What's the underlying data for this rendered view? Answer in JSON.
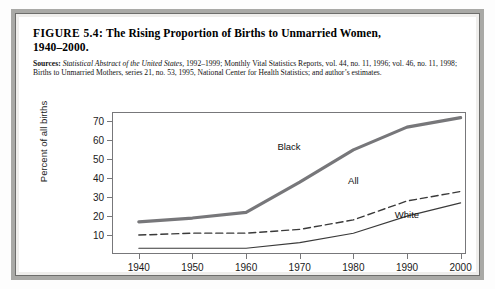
{
  "figure": {
    "label": "FIGURE 5.4:",
    "title_line1": "The Rising Proportion of Births to Unmarried Women,",
    "title_line2": "1940–2000.",
    "sources_label": "Sources:",
    "sources_italic": "Statistical Abstract of the United States,",
    "sources_text": " 1992–1999; Monthly Vital Statistics Reports, vol. 44, no. 11, 1996; vol. 46, no. 11, 1998; Births to Unmarried Mothers, series 21, no. 53, 1995, National Center for Health Statistics; and author’s estimates."
  },
  "chart_data": {
    "type": "line",
    "title": "The Rising Proportion of Births to Unmarried Women, 1940–2000.",
    "xlabel": "",
    "ylabel": "Percent of all births",
    "x": [
      1940,
      1950,
      1960,
      1970,
      1980,
      1990,
      2000
    ],
    "xlim": [
      1935,
      2001
    ],
    "ylim": [
      0,
      75
    ],
    "yticks": [
      10,
      20,
      30,
      40,
      50,
      60,
      70
    ],
    "xticks": [
      1940,
      1950,
      1960,
      1970,
      1980,
      1990,
      2000
    ],
    "grid": false,
    "legend": "inline-labels",
    "series": [
      {
        "name": "Black",
        "style": "solid-thick",
        "color": "#77777a",
        "label_x": 1968,
        "label_y": 57,
        "values": [
          17,
          19,
          22,
          38,
          55,
          67,
          72
        ]
      },
      {
        "name": "All",
        "style": "dashed",
        "color": "#3a3a3a",
        "label_x": 1980,
        "label_y": 39,
        "values": [
          10,
          11,
          11,
          13,
          18,
          28,
          33
        ]
      },
      {
        "name": "White",
        "style": "solid-thin",
        "color": "#3a3a3a",
        "label_x": 1990,
        "label_y": 21,
        "values": [
          3,
          3,
          3,
          6,
          11,
          20,
          27
        ]
      }
    ]
  }
}
